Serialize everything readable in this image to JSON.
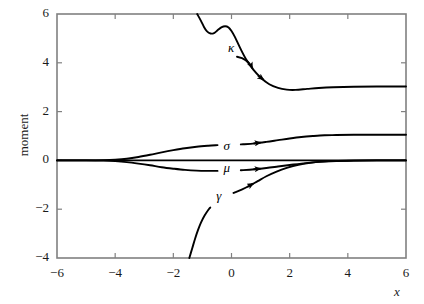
{
  "chart_data": {
    "type": "line",
    "title": "",
    "xlabel": "x",
    "ylabel": "moment",
    "xlim": [
      -6,
      6
    ],
    "ylim": [
      -4,
      6
    ],
    "grid": false,
    "legend_position": "inline-curve-labels",
    "x_ticks": [
      -6,
      -4,
      -2,
      0,
      2,
      4,
      6
    ],
    "x_tick_labels": [
      "−6",
      "−4",
      "−2",
      "0",
      "2",
      "4",
      "6"
    ],
    "y_ticks": [
      -4,
      -2,
      0,
      2,
      4,
      6
    ],
    "y_tick_labels": [
      "−4",
      "−2",
      "0",
      "2",
      "4",
      "6"
    ],
    "series": [
      {
        "name": "kappa",
        "label": "κ",
        "label_x": 0.05,
        "label_y": 4.55,
        "asymptote_right": 3.0,
        "arrow_x": 1.1,
        "points": [
          [
            -1.18,
            6.0
          ],
          [
            -1.05,
            5.72
          ],
          [
            -0.95,
            5.48
          ],
          [
            -0.85,
            5.3
          ],
          [
            -0.72,
            5.2
          ],
          [
            -0.6,
            5.22
          ],
          [
            -0.48,
            5.33
          ],
          [
            -0.35,
            5.45
          ],
          [
            -0.22,
            5.5
          ],
          [
            -0.1,
            5.45
          ],
          [
            0.0,
            5.3
          ],
          [
            0.12,
            5.05
          ],
          [
            0.3,
            4.6
          ],
          [
            0.5,
            4.15
          ],
          [
            0.75,
            3.72
          ],
          [
            1.0,
            3.4
          ],
          [
            1.3,
            3.12
          ],
          [
            1.6,
            2.97
          ],
          [
            1.9,
            2.9
          ],
          [
            2.2,
            2.89
          ],
          [
            2.6,
            2.93
          ],
          [
            3.0,
            2.97
          ],
          [
            3.5,
            3.0
          ],
          [
            4.2,
            3.02
          ],
          [
            5.0,
            3.03
          ],
          [
            6.0,
            3.03
          ]
        ]
      },
      {
        "name": "sigma",
        "label": "σ",
        "label_x": -0.1,
        "label_y": 0.56,
        "asymptote_right": 1.05,
        "arrow_x": 1.0,
        "points": [
          [
            -6.0,
            0.0
          ],
          [
            -5.0,
            0.0
          ],
          [
            -4.4,
            0.01
          ],
          [
            -4.0,
            0.03
          ],
          [
            -3.6,
            0.07
          ],
          [
            -3.2,
            0.14
          ],
          [
            -2.8,
            0.23
          ],
          [
            -2.4,
            0.33
          ],
          [
            -2.0,
            0.42
          ],
          [
            -1.6,
            0.5
          ],
          [
            -1.2,
            0.56
          ],
          [
            -0.8,
            0.6
          ],
          [
            -0.4,
            0.63
          ],
          [
            0.0,
            0.64
          ],
          [
            0.4,
            0.66
          ],
          [
            0.8,
            0.7
          ],
          [
            1.2,
            0.76
          ],
          [
            1.6,
            0.83
          ],
          [
            2.0,
            0.9
          ],
          [
            2.4,
            0.96
          ],
          [
            2.8,
            1.0
          ],
          [
            3.2,
            1.03
          ],
          [
            3.6,
            1.04
          ],
          [
            4.2,
            1.05
          ],
          [
            5.0,
            1.05
          ],
          [
            6.0,
            1.05
          ]
        ]
      },
      {
        "name": "mu",
        "label": "μ",
        "label_x": -0.1,
        "label_y": -0.34,
        "asymptote_right": 0.02,
        "arrow_x": 1.0,
        "points": [
          [
            -6.0,
            0.0
          ],
          [
            -5.0,
            0.0
          ],
          [
            -4.4,
            -0.01
          ],
          [
            -4.0,
            -0.03
          ],
          [
            -3.6,
            -0.07
          ],
          [
            -3.2,
            -0.13
          ],
          [
            -2.8,
            -0.2
          ],
          [
            -2.4,
            -0.28
          ],
          [
            -2.0,
            -0.34
          ],
          [
            -1.6,
            -0.39
          ],
          [
            -1.2,
            -0.42
          ],
          [
            -0.8,
            -0.43
          ],
          [
            -0.4,
            -0.43
          ],
          [
            0.0,
            -0.42
          ],
          [
            0.4,
            -0.4
          ],
          [
            0.8,
            -0.36
          ],
          [
            1.2,
            -0.31
          ],
          [
            1.6,
            -0.25
          ],
          [
            2.0,
            -0.19
          ],
          [
            2.4,
            -0.13
          ],
          [
            2.8,
            -0.08
          ],
          [
            3.2,
            -0.05
          ],
          [
            3.6,
            -0.03
          ],
          [
            4.2,
            -0.01
          ],
          [
            5.0,
            0.0
          ],
          [
            6.0,
            0.0
          ]
        ]
      },
      {
        "name": "gamma",
        "label": "γ",
        "label_x": -0.35,
        "label_y": -1.5,
        "asymptote_right": 0.0,
        "arrow_x": 0.75,
        "points": [
          [
            -1.45,
            -4.0
          ],
          [
            -1.35,
            -3.6
          ],
          [
            -1.25,
            -3.2
          ],
          [
            -1.15,
            -2.85
          ],
          [
            -1.05,
            -2.55
          ],
          [
            -0.92,
            -2.25
          ],
          [
            -0.78,
            -2.0
          ],
          [
            -0.62,
            -1.78
          ],
          [
            -0.45,
            -1.6
          ],
          [
            -0.28,
            -1.48
          ],
          [
            -0.1,
            -1.4
          ],
          [
            0.1,
            -1.32
          ],
          [
            0.35,
            -1.2
          ],
          [
            0.6,
            -1.05
          ],
          [
            0.9,
            -0.85
          ],
          [
            1.2,
            -0.65
          ],
          [
            1.55,
            -0.46
          ],
          [
            1.9,
            -0.31
          ],
          [
            2.3,
            -0.18
          ],
          [
            2.7,
            -0.1
          ],
          [
            3.1,
            -0.05
          ],
          [
            3.6,
            -0.02
          ],
          [
            4.2,
            -0.01
          ],
          [
            5.0,
            0.0
          ],
          [
            6.0,
            0.0
          ]
        ]
      }
    ],
    "baseline": {
      "name": "zero-line",
      "value": 0.0,
      "x_from": -6,
      "x_to": 6
    },
    "colors": {
      "curve": "#000000",
      "axis": "#808080",
      "text": "#1a1a1a"
    }
  }
}
